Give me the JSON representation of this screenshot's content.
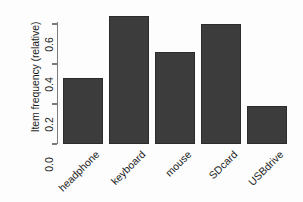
{
  "chart_data": {
    "type": "bar",
    "title": "",
    "subtitle": "",
    "xlabel": "",
    "ylabel": "Item frequency (relative)",
    "categories": [
      "headphone",
      "keyboard",
      "mouse",
      "SDcard",
      "USBdrive"
    ],
    "values": [
      0.33,
      0.64,
      0.46,
      0.6,
      0.19
    ],
    "ylim": [
      0,
      0.68
    ],
    "yticks": [
      0.0,
      0.2,
      0.4,
      0.6
    ],
    "ytick_labels": [
      "0.0",
      "0.2",
      "0.4",
      "0.6"
    ],
    "grid": false,
    "legend": false,
    "legend_position": "none",
    "bar_color": "#3c3c3c",
    "axis_color": "#7c7c7c",
    "background_color": "#fdfdfd",
    "xlabel_rotation": 45
  },
  "axis": {
    "y_title": "Item frequency (relative)"
  }
}
